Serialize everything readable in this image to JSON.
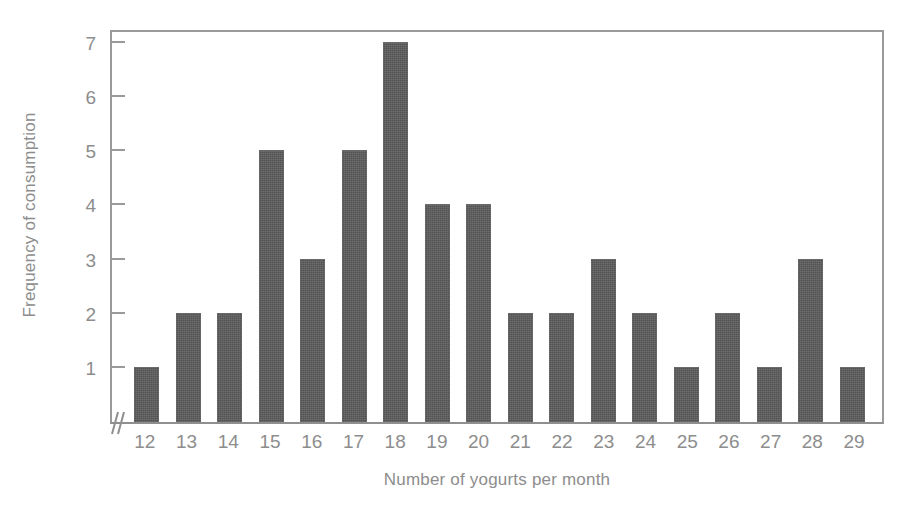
{
  "chart_data": {
    "type": "bar",
    "title": "",
    "xlabel": "Number of yogurts per month",
    "ylabel": "Frequency of consumption",
    "categories": [
      "12",
      "13",
      "14",
      "15",
      "16",
      "17",
      "18",
      "19",
      "20",
      "21",
      "22",
      "23",
      "24",
      "25",
      "26",
      "27",
      "28",
      "29"
    ],
    "values": [
      1,
      2,
      2,
      5,
      3,
      5,
      7,
      4,
      4,
      2,
      2,
      3,
      2,
      1,
      2,
      1,
      3,
      1
    ],
    "ytick_labels": [
      "7",
      "6",
      "5",
      "4",
      "3",
      "2",
      "1"
    ],
    "ytick_values": [
      7,
      6,
      5,
      4,
      3,
      2,
      1
    ],
    "ylim": [
      0,
      7.2
    ],
    "grid": false,
    "legend": null,
    "axis_break_x_origin": true,
    "bar_color": "#5c5c5c",
    "axis_color": "#9a9a9a",
    "text_color": "#8d8d8d"
  },
  "figure": {
    "top_cropped_text": "",
    "background_color": "#ffffff"
  }
}
